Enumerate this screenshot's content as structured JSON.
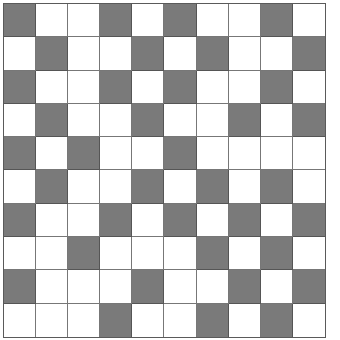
{
  "grid": {
    "rows": 10,
    "cols": 10,
    "colors": {
      "dark": "#7a7a7a",
      "light": "#ffffff",
      "line": "#777777"
    },
    "cells": [
      [
        1,
        0,
        0,
        1,
        0,
        1,
        0,
        0,
        1,
        0
      ],
      [
        0,
        1,
        0,
        0,
        1,
        0,
        1,
        0,
        0,
        1
      ],
      [
        1,
        0,
        0,
        1,
        0,
        1,
        0,
        0,
        1,
        0
      ],
      [
        0,
        1,
        0,
        0,
        1,
        0,
        0,
        1,
        0,
        1
      ],
      [
        1,
        0,
        1,
        0,
        0,
        1,
        0,
        0,
        0,
        0
      ],
      [
        0,
        1,
        0,
        0,
        1,
        0,
        1,
        0,
        1,
        0
      ],
      [
        1,
        0,
        0,
        1,
        0,
        1,
        0,
        1,
        0,
        1
      ],
      [
        0,
        0,
        1,
        0,
        0,
        0,
        1,
        0,
        1,
        0
      ],
      [
        1,
        0,
        0,
        0,
        1,
        0,
        0,
        1,
        0,
        1
      ],
      [
        0,
        0,
        0,
        1,
        0,
        0,
        1,
        0,
        1,
        0
      ]
    ]
  }
}
